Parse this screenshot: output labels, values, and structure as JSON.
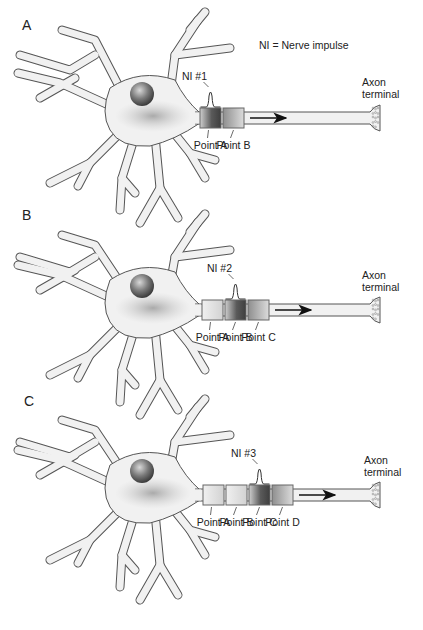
{
  "legend": "NI = Nerve impulse",
  "colors": {
    "outline": "#555555",
    "cell_fill": "#f1f1f1",
    "impulse_dark": "#4a4a4a",
    "impulse_light": "#9a9a9a",
    "nucleus": "#6e6e6e"
  },
  "panels": [
    {
      "letter": "A",
      "impulse_label": "NI #1",
      "impulse_at": "Point A",
      "points": [
        "Point A",
        "Point B"
      ],
      "terminal_label_line1": "Axon",
      "terminal_label_line2": "terminal"
    },
    {
      "letter": "B",
      "impulse_label": "NI #2",
      "impulse_at": "Point B",
      "points": [
        "Point A",
        "Point B",
        "Point C"
      ],
      "terminal_label_line1": "Axon",
      "terminal_label_line2": "terminal"
    },
    {
      "letter": "C",
      "impulse_label": "NI #3",
      "impulse_at": "Point C",
      "points": [
        "Point A",
        "Point B",
        "Point C",
        "Point D"
      ],
      "terminal_label_line1": "Axon",
      "terminal_label_line2": "terminal"
    }
  ]
}
